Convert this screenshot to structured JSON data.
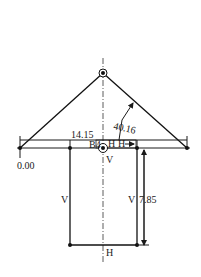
{
  "diagram": {
    "type": "mechanism-sketch",
    "dimensions": {
      "origin_label": "0.00",
      "horizontal_offset": "14.15",
      "link_length": "40.16",
      "vertical_offset": "7.85"
    },
    "labels": {
      "block": "B4",
      "constraint_h1": "H",
      "constraint_h2": "H",
      "constraint_v_center": "V",
      "constraint_v_left": "V",
      "constraint_v_right": "V",
      "constraint_h_bottom": "H"
    },
    "colors": {
      "line": "#1a1a1a",
      "background": "#ffffff"
    }
  }
}
